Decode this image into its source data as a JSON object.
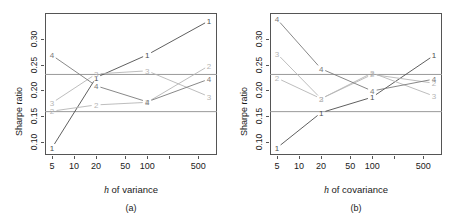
{
  "figure": {
    "width": 453,
    "height": 224,
    "background": "#ffffff",
    "axis_color": "#555555",
    "hline_color": "#9a9a9a",
    "series_colors": {
      "1": "#4d4d4d",
      "2": "#b5b5b5",
      "3": "#b5b5b5",
      "4": "#7a7a7a"
    }
  },
  "chart_data": [
    {
      "type": "line",
      "panel": "a",
      "panel_label": "(a)",
      "title": "",
      "xlabel": "h of variance",
      "xlabel_italic_prefix": "h",
      "xlabel_rest": " of variance",
      "ylabel": "Sharpe ratio",
      "xscale": "log",
      "xlim": [
        4.0,
        900
      ],
      "ylim": [
        0.075,
        0.35
      ],
      "grid": false,
      "legend": "none",
      "xticks": [
        5,
        10,
        20,
        50,
        100,
        200,
        500
      ],
      "xticklabels": [
        "5",
        "10",
        "20",
        "50",
        "100",
        "",
        "500"
      ],
      "yticks": [
        0.1,
        0.15,
        0.2,
        0.25,
        0.3
      ],
      "yticklabels": [
        "0.10",
        "0.15",
        "0.20",
        "0.25",
        "0.30"
      ],
      "hlines": [
        0.159,
        0.231
      ],
      "x": [
        5,
        20,
        100,
        700
      ],
      "series": [
        {
          "name": "1",
          "label": "1",
          "values": [
            0.089,
            0.225,
            0.269,
            0.335
          ]
        },
        {
          "name": "2",
          "label": "2",
          "values": [
            0.16,
            0.172,
            0.177,
            0.248
          ]
        },
        {
          "name": "3",
          "label": "3",
          "values": [
            0.176,
            0.232,
            0.238,
            0.188
          ]
        },
        {
          "name": "4",
          "label": "4",
          "values": [
            0.268,
            0.209,
            0.178,
            0.222
          ]
        }
      ]
    },
    {
      "type": "line",
      "panel": "b",
      "panel_label": "(b)",
      "title": "",
      "xlabel": "h of covariance",
      "xlabel_italic_prefix": "h",
      "xlabel_rest": " of covariance",
      "ylabel": "Sharpe ratio",
      "xscale": "log",
      "xlim": [
        4.0,
        900
      ],
      "ylim": [
        0.075,
        0.35
      ],
      "grid": false,
      "legend": "none",
      "xticks": [
        5,
        10,
        20,
        50,
        100,
        200,
        500
      ],
      "xticklabels": [
        "5",
        "10",
        "20",
        "50",
        "100",
        "",
        "500"
      ],
      "yticks": [
        0.1,
        0.15,
        0.2,
        0.25,
        0.3
      ],
      "yticklabels": [
        "0.10",
        "0.15",
        "0.20",
        "0.25",
        "0.30"
      ],
      "hlines": [
        0.159,
        0.231
      ],
      "x": [
        5,
        20,
        100,
        700
      ],
      "series": [
        {
          "name": "1",
          "label": "1",
          "values": [
            0.089,
            0.157,
            0.187,
            0.268
          ]
        },
        {
          "name": "2",
          "label": "2",
          "values": [
            0.224,
            0.184,
            0.231,
            0.214
          ]
        },
        {
          "name": "3",
          "label": "3",
          "values": [
            0.271,
            0.184,
            0.234,
            0.189
          ]
        },
        {
          "name": "4",
          "label": "4",
          "values": [
            0.338,
            0.242,
            0.199,
            0.222
          ]
        }
      ]
    }
  ]
}
